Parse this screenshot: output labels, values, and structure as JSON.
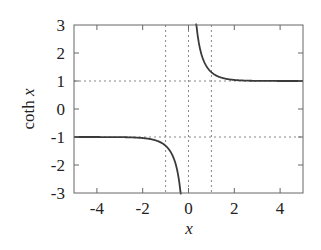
{
  "chart_data": {
    "type": "line",
    "title": "",
    "xlabel": "x",
    "ylabel": "coth x",
    "xlim": [
      -5,
      5
    ],
    "ylim": [
      -3,
      3
    ],
    "x_ticks": [
      -4,
      -2,
      0,
      2,
      4
    ],
    "x_tick_labels": [
      "-4",
      "-2",
      "0",
      "2",
      "4"
    ],
    "y_ticks": [
      -3,
      -2,
      -1,
      0,
      1,
      2,
      3
    ],
    "y_tick_labels": [
      "-3",
      "-2",
      "-1",
      "0",
      "1",
      "2",
      "3"
    ],
    "grid": false,
    "reference_lines": {
      "vertical_dotted": [
        -1,
        0,
        1
      ],
      "horizontal_dotted": [
        -1,
        1
      ]
    },
    "legend": null,
    "series": [
      {
        "name": "coth x (negative branch)",
        "function": "coth",
        "x_range": [
          -5,
          -0.33
        ],
        "x": [
          -5,
          -4,
          -3,
          -2,
          -1.5,
          -1,
          -0.75,
          -0.5,
          -0.4,
          -0.33
        ],
        "values": [
          -1.0001,
          -1.0007,
          -1.005,
          -1.037,
          -1.105,
          -1.313,
          -1.572,
          -2.164,
          -2.632,
          -3.1
        ]
      },
      {
        "name": "coth x (positive branch)",
        "function": "coth",
        "x_range": [
          0.33,
          5
        ],
        "x": [
          0.33,
          0.4,
          0.5,
          0.75,
          1,
          1.5,
          2,
          3,
          4,
          5
        ],
        "values": [
          3.1,
          2.632,
          2.164,
          1.572,
          1.313,
          1.105,
          1.037,
          1.005,
          1.0007,
          1.0001
        ]
      }
    ],
    "colors": {
      "curve": "#3a3a3a",
      "axes": "#555555",
      "reference": "#888888",
      "text": "#222222"
    }
  }
}
